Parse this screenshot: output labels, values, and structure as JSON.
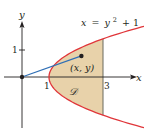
{
  "figure": {
    "type": "region-diagram",
    "colors": {
      "curve": "#e0363a",
      "region_fill": "#e8d2aa",
      "region_edge": "#6b6b5e",
      "segment": "#2f6fb5",
      "axis": "#231f20",
      "text": "#231f20"
    },
    "axes": {
      "x_label": "x",
      "y_label": "y",
      "x_ticks": [
        {
          "value": 1,
          "label": "1"
        },
        {
          "value": 3,
          "label": "3"
        }
      ],
      "y_ticks": [
        {
          "value": 1,
          "label": "1"
        }
      ]
    },
    "curve": {
      "equation_label": "x = y² + 1",
      "eq_lhs": "x",
      "eq_eq": "=",
      "eq_y": "y",
      "eq_exp": "2",
      "eq_rest": "+ 1"
    },
    "region": {
      "label": "𝒟",
      "bounds": "y² + 1 ≤ x ≤ 3"
    },
    "point": {
      "label": "(x, y)",
      "x": 2.2,
      "y": 0.78
    },
    "segment": {
      "from": [
        0,
        0
      ],
      "to": [
        2.2,
        0.78
      ]
    }
  }
}
